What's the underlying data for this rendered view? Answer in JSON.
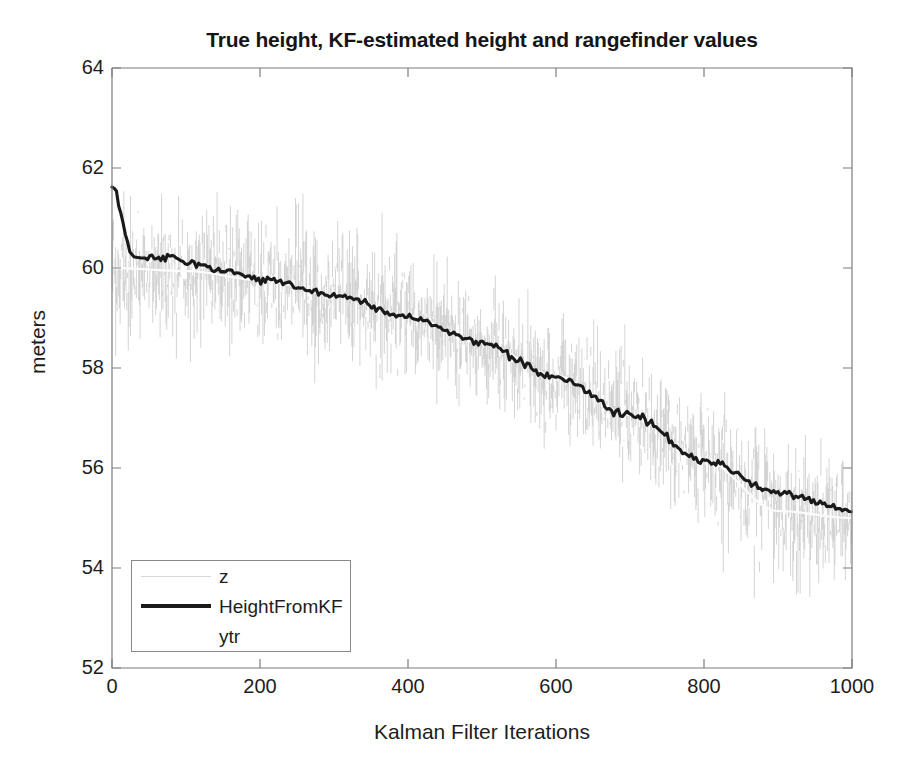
{
  "chart_data": {
    "type": "line",
    "title": "True height, KF-estimated height and rangefinder values",
    "xlabel": "Kalman Filter Iterations",
    "ylabel": "meters",
    "xlim": [
      0,
      1000
    ],
    "ylim": [
      52,
      64
    ],
    "xticks": [
      0,
      200,
      400,
      600,
      800,
      1000
    ],
    "yticks": [
      52,
      54,
      56,
      58,
      60,
      62,
      64
    ],
    "grid": false,
    "legend_position": "lower-left",
    "legend": [
      {
        "name": "z",
        "style": "thin light-gray noisy scatter",
        "color": "#c9c9c9"
      },
      {
        "name": "HeightFromKF",
        "style": "thick black line",
        "color": "#1a1a1a"
      },
      {
        "name": "ytr",
        "style": "thin white/near-white line",
        "color": "#fdfdfd"
      }
    ],
    "series": [
      {
        "name": "ytr",
        "description": "True height, quadratic free-fall style descent",
        "x": [
          0,
          100,
          200,
          300,
          400,
          500,
          600,
          700,
          800,
          900,
          1000
        ],
        "values": [
          60.0,
          59.94,
          59.76,
          59.46,
          59.04,
          58.5,
          57.84,
          57.06,
          56.16,
          55.14,
          55.0
        ]
      },
      {
        "name": "HeightFromKF",
        "description": "Kalman filter estimate; starts at 61.6 and converges to true curve within ~40 iterations",
        "x": [
          0,
          5,
          10,
          15,
          20,
          25,
          30,
          40,
          60,
          80,
          100,
          150,
          200,
          300,
          400,
          500,
          600,
          700,
          800,
          900,
          1000
        ],
        "values": [
          61.62,
          61.58,
          61.2,
          60.9,
          60.55,
          60.3,
          60.22,
          60.2,
          60.18,
          60.22,
          60.1,
          59.92,
          59.78,
          59.46,
          59.02,
          58.5,
          57.82,
          57.04,
          56.15,
          55.5,
          55.16
        ]
      },
      {
        "name": "z",
        "description": "Rangefinder measurements: true curve plus gaussian noise, std ~0.6 m, visible spread roughly +/- 1.7 m, peak excursions to 63.4 at iteration ~300 and down to 53.3 near iteration ~940",
        "noise_std": 0.6,
        "n_points": 1000,
        "observed_max": 63.4,
        "observed_min": 53.3
      }
    ]
  },
  "axes": {
    "title": "True height, KF-estimated height and rangefinder values",
    "xlabel": "Kalman Filter Iterations",
    "ylabel": "meters",
    "xticks": [
      "0",
      "200",
      "400",
      "600",
      "800",
      "1000"
    ],
    "yticks": [
      "64",
      "62",
      "60",
      "58",
      "56",
      "54",
      "52"
    ]
  },
  "legend": {
    "entries": [
      "z",
      "HeightFromKF",
      "ytr"
    ]
  },
  "colors": {
    "axis": "#7d7d7d",
    "text": "#1d1d1d",
    "kf_line": "#1a1a1a",
    "noise": "#c9c9c9",
    "true_line": "#fdfdfd"
  }
}
